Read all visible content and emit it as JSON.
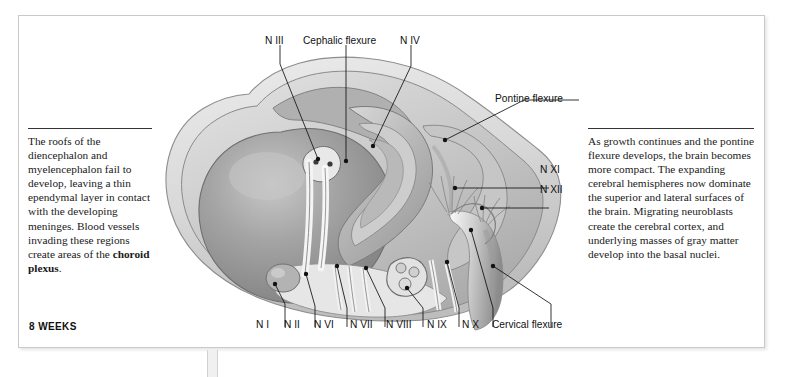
{
  "figure": {
    "stage_caption": "8 WEEKS"
  },
  "notes": {
    "left": "The roofs of the diencephalon and myelencephalon fail to develop, leaving a thin ependymal layer in contact with the developing meninges. Blood vessels invading these regions create areas of the ",
    "left_bold": "choroid plexus",
    "left_tail": ".",
    "right": "As growth continues and the pontine flexure develops, the brain becomes more compact. The expanding cerebral hemispheres now dominate the superior and lateral surfaces of the brain. Migrating neuroblasts create the cerebral cortex, and underlying masses of gray matter develop into the basal nuclei."
  },
  "labels": {
    "top": [
      {
        "id": "n3",
        "text": "N III"
      },
      {
        "id": "cephalic",
        "text": "Cephalic flexure"
      },
      {
        "id": "n4",
        "text": "N IV"
      },
      {
        "id": "pontine",
        "text": "Pontine flexure"
      }
    ],
    "right": [
      {
        "id": "n11",
        "text": "N XI"
      },
      {
        "id": "n12",
        "text": "N XII"
      }
    ],
    "bottom": [
      {
        "id": "n1",
        "text": "N I"
      },
      {
        "id": "n2",
        "text": "N II"
      },
      {
        "id": "n6",
        "text": "N VI"
      },
      {
        "id": "n7",
        "text": "N VII"
      },
      {
        "id": "n8",
        "text": "N VIII"
      },
      {
        "id": "n9",
        "text": "N IX"
      },
      {
        "id": "n10",
        "text": "N X"
      },
      {
        "id": "cervical",
        "text": "Cervical flexure"
      }
    ]
  },
  "colors": {
    "frame_border": "#c9c9c9",
    "page_background": "#ffffff",
    "meninges_outer": "#e3e3e3",
    "meninges_mid": "#cfcfcf",
    "hemisphere": "#9a9a9a",
    "hemisphere_highlight": "#c4c4c4",
    "brainstem": "#b5b5b5",
    "ink": "#111111",
    "tab": "#f0f0f0"
  }
}
